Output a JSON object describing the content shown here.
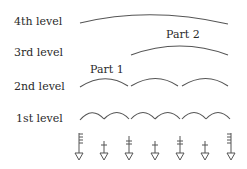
{
  "diagram": {
    "levels": [
      {
        "label": "4th level",
        "y": 17
      },
      {
        "label": "3rd level",
        "y": 47
      },
      {
        "label": "2nd level",
        "y": 82
      },
      {
        "label": "1st level",
        "y": 114
      }
    ],
    "part_labels": [
      {
        "text": "Part 1",
        "x": 89,
        "y": 64
      },
      {
        "text": "Part 2",
        "x": 153,
        "y": 29
      }
    ],
    "symbols": [
      "flag-left",
      "single-cross",
      "double-cross",
      "single-cross",
      "double-cross",
      "single-cross",
      "flag-right"
    ],
    "stroke_color": "#555555"
  }
}
